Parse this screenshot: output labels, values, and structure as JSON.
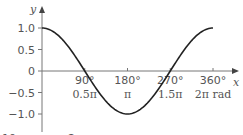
{
  "chart_data": {
    "type": "line",
    "title": "",
    "xlabel": "x",
    "ylabel": "y",
    "function": "y = cos(x)",
    "xlim": [
      0,
      360
    ],
    "ylim": [
      -1.0,
      1.0
    ],
    "grid": false,
    "legend": "none",
    "series": [
      {
        "name": "cos x",
        "x": [
          0,
          30,
          60,
          90,
          120,
          150,
          180,
          210,
          240,
          270,
          300,
          330,
          360
        ],
        "y": [
          1.0,
          0.866,
          0.5,
          0.0,
          -0.5,
          -0.866,
          -1.0,
          -0.866,
          -0.5,
          0.0,
          0.5,
          0.866,
          1.0
        ]
      }
    ],
    "y_ticks": [
      {
        "value": 1.0,
        "label": "1.0"
      },
      {
        "value": 0.5,
        "label": "0.5"
      },
      {
        "value": 0,
        "label": "0"
      },
      {
        "value": -0.5,
        "label": "−0.5"
      },
      {
        "value": -1.0,
        "label": "−1.0"
      }
    ],
    "x_ticks": [
      {
        "value": 90,
        "label": "90°",
        "sublabel": "0.5π"
      },
      {
        "value": 180,
        "label": "180°",
        "sublabel": "π"
      },
      {
        "value": 270,
        "label": "270°",
        "sublabel": "1.5π"
      },
      {
        "value": 360,
        "label": "360°",
        "sublabel": "2π rad"
      }
    ],
    "colors": {
      "curve": "#222222",
      "axis": "#777777",
      "text": "#555555"
    }
  },
  "cut_off_text": [
    "10",
    "2"
  ]
}
